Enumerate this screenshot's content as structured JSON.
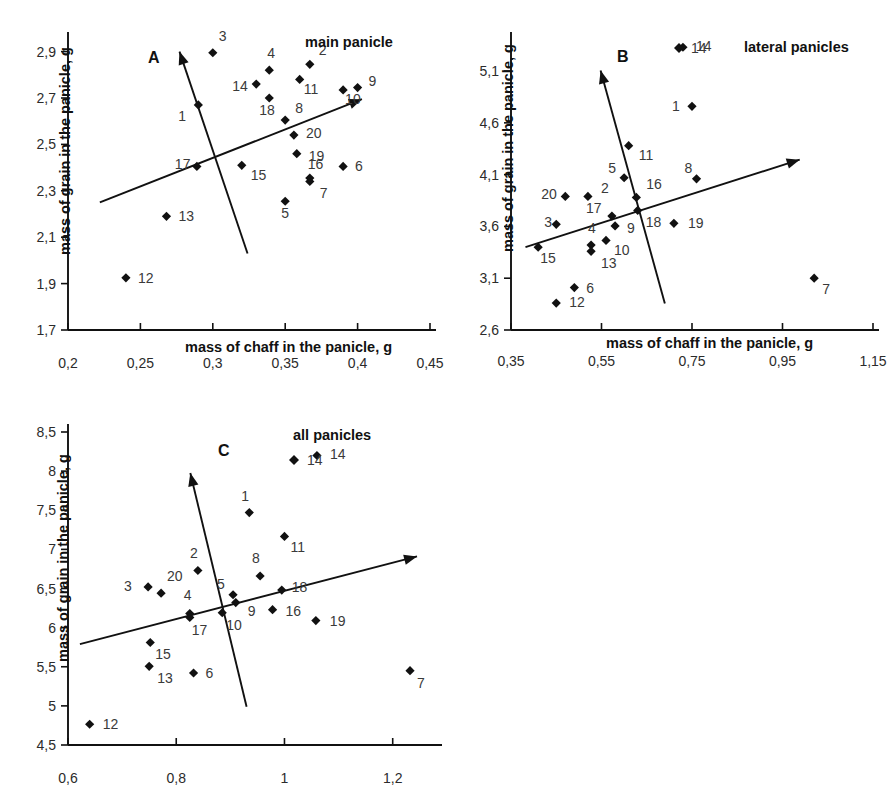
{
  "figure": {
    "axis_x_title": "mass of chaff in the panicle, g",
    "axis_y_title": "mass of grain in the panicle, g"
  },
  "chart_data": [
    {
      "type": "scatter",
      "panel": "A",
      "title": "main panicle",
      "xlabel": "mass of chaff in the panicle, g",
      "ylabel": "mass of grain in the panicle, g",
      "xlim": [
        0.2,
        0.45
      ],
      "ylim": [
        1.7,
        2.95
      ],
      "xticks": [
        "0,2",
        "0,25",
        "0,3",
        "0,35",
        "0,4",
        "0,45"
      ],
      "xtick_values": [
        0.2,
        0.25,
        0.3,
        0.35,
        0.4,
        0.45
      ],
      "yticks": [
        "1,7",
        "1,9",
        "2,1",
        "2,3",
        "2,5",
        "2,7",
        "2,9"
      ],
      "ytick_values": [
        1.7,
        1.9,
        2.1,
        2.3,
        2.5,
        2.7,
        2.9
      ],
      "grid": false,
      "legend": null,
      "points": [
        {
          "label": "1",
          "x": 0.29,
          "y": 2.67,
          "lx": -20,
          "ly": 16
        },
        {
          "label": "2",
          "x": 0.367,
          "y": 2.845,
          "lx": 9,
          "ly": -9
        },
        {
          "label": "3",
          "x": 0.3,
          "y": 2.895,
          "lx": 6,
          "ly": -12
        },
        {
          "label": "4",
          "x": 0.339,
          "y": 2.82,
          "lx": -2,
          "ly": -12
        },
        {
          "label": "5",
          "x": 0.35,
          "y": 2.255,
          "lx": -4,
          "ly": 17
        },
        {
          "label": "6",
          "x": 0.39,
          "y": 2.405,
          "lx": 12,
          "ly": 5
        },
        {
          "label": "7",
          "x": 0.367,
          "y": 2.34,
          "lx": 10,
          "ly": 16
        },
        {
          "label": "8",
          "x": 0.35,
          "y": 2.605,
          "lx": 10,
          "ly": -7
        },
        {
          "label": "9",
          "x": 0.4,
          "y": 2.745,
          "lx": 11,
          "ly": -2
        },
        {
          "label": "10",
          "x": 0.39,
          "y": 2.735,
          "lx": 2,
          "ly": 14
        },
        {
          "label": "11",
          "x": 0.36,
          "y": 2.78,
          "lx": 4,
          "ly": 15
        },
        {
          "label": "12",
          "x": 0.24,
          "y": 1.925,
          "lx": 12,
          "ly": 5
        },
        {
          "label": "13",
          "x": 0.268,
          "y": 2.19,
          "lx": 12,
          "ly": 5
        },
        {
          "label": "14",
          "x": 0.33,
          "y": 2.76,
          "lx": -24,
          "ly": 7
        },
        {
          "label": "15",
          "x": 0.32,
          "y": 2.41,
          "lx": 9,
          "ly": 15
        },
        {
          "label": "16",
          "x": 0.367,
          "y": 2.355,
          "lx": -2,
          "ly": -9
        },
        {
          "label": "17",
          "x": 0.289,
          "y": 2.405,
          "lx": -22,
          "ly": 3
        },
        {
          "label": "18",
          "x": 0.339,
          "y": 2.7,
          "lx": -10,
          "ly": 17
        },
        {
          "label": "19",
          "x": 0.358,
          "y": 2.46,
          "lx": 12,
          "ly": 7
        },
        {
          "label": "20",
          "x": 0.356,
          "y": 2.54,
          "lx": 12,
          "ly": 3
        }
      ],
      "vectors": [
        {
          "name": "pc1",
          "x1": 0.222,
          "y1": 2.25,
          "x2": 0.403,
          "y2": 2.695
        },
        {
          "name": "pc2",
          "x1": 0.324,
          "y1": 2.03,
          "x2": 0.277,
          "y2": 2.9
        }
      ]
    },
    {
      "type": "scatter",
      "panel": "B",
      "title": "lateral panicles",
      "xlabel": "mass of chaff in the panicle, g",
      "ylabel": "mass of grain in the panicle, g",
      "xlim": [
        0.35,
        1.15
      ],
      "ylim": [
        2.6,
        5.4
      ],
      "xticks": [
        "0,35",
        "0,55",
        "0,75",
        "0,95",
        "1,15"
      ],
      "xtick_values": [
        0.35,
        0.55,
        0.75,
        0.95,
        1.15
      ],
      "yticks": [
        "2,6",
        "3,1",
        "3,6",
        "4,1",
        "4,6",
        "5,1"
      ],
      "ytick_values": [
        2.6,
        3.1,
        3.6,
        4.1,
        4.6,
        5.1
      ],
      "grid": false,
      "legend": {
        "label": "14",
        "marker": "diamond"
      },
      "points": [
        {
          "label": "1",
          "x": 0.75,
          "y": 4.76,
          "lx": -20,
          "ly": 5
        },
        {
          "label": "2",
          "x": 0.52,
          "y": 3.89,
          "lx": 13,
          "ly": -3
        },
        {
          "label": "3",
          "x": 0.45,
          "y": 3.62,
          "lx": -12,
          "ly": 3
        },
        {
          "label": "4",
          "x": 0.527,
          "y": 3.42,
          "lx": -3,
          "ly": -12
        },
        {
          "label": "5",
          "x": 0.6,
          "y": 4.07,
          "lx": -16,
          "ly": -5
        },
        {
          "label": "6",
          "x": 0.49,
          "y": 3.01,
          "lx": 12,
          "ly": 5
        },
        {
          "label": "7",
          "x": 1.02,
          "y": 3.1,
          "lx": 8,
          "ly": 16
        },
        {
          "label": "8",
          "x": 0.76,
          "y": 4.06,
          "lx": -12,
          "ly": -6
        },
        {
          "label": "9",
          "x": 0.58,
          "y": 3.605,
          "lx": 12,
          "ly": 7
        },
        {
          "label": "10",
          "x": 0.56,
          "y": 3.465,
          "lx": 8,
          "ly": 15
        },
        {
          "label": "11",
          "x": 0.61,
          "y": 4.38,
          "lx": 10,
          "ly": 14
        },
        {
          "label": "12",
          "x": 0.45,
          "y": 2.86,
          "lx": 13,
          "ly": 4
        },
        {
          "label": "13",
          "x": 0.527,
          "y": 3.36,
          "lx": 10,
          "ly": 17
        },
        {
          "label": "14",
          "x": 0.73,
          "y": 5.33,
          "lx": 13,
          "ly": 4
        },
        {
          "label": "15",
          "x": 0.41,
          "y": 3.4,
          "lx": 2,
          "ly": 16
        },
        {
          "label": "16",
          "x": 0.627,
          "y": 3.88,
          "lx": 10,
          "ly": -8
        },
        {
          "label": "17",
          "x": 0.573,
          "y": 3.7,
          "lx": -26,
          "ly": -3
        },
        {
          "label": "18",
          "x": 0.63,
          "y": 3.755,
          "lx": 8,
          "ly": 17
        },
        {
          "label": "19",
          "x": 0.71,
          "y": 3.63,
          "lx": 14,
          "ly": 5
        },
        {
          "label": "20",
          "x": 0.47,
          "y": 3.89,
          "lx": -24,
          "ly": 3
        }
      ],
      "vectors": [
        {
          "name": "pc1",
          "x1": 0.382,
          "y1": 3.4,
          "x2": 0.988,
          "y2": 4.245
        },
        {
          "name": "pc2",
          "x1": 0.69,
          "y1": 2.855,
          "x2": 0.548,
          "y2": 5.105
        }
      ]
    },
    {
      "type": "scatter",
      "panel": "C",
      "title": "all panicles",
      "xlabel": "mass of chaff in the panicle, g",
      "ylabel": "mass of grain in the panicle, g",
      "xlim": [
        0.6,
        1.28
      ],
      "ylim": [
        4.5,
        8.5
      ],
      "xticks": [
        "0,6",
        "0,8",
        "1",
        "1,2"
      ],
      "xtick_values": [
        0.6,
        0.8,
        1.0,
        1.2
      ],
      "yticks": [
        "4,5",
        "5",
        "5,5",
        "6",
        "6,5",
        "7",
        "7,5",
        "8",
        "8,5"
      ],
      "ytick_values": [
        4.5,
        5.0,
        5.5,
        6.0,
        6.5,
        7.0,
        7.5,
        8.0,
        8.5
      ],
      "grid": false,
      "legend": {
        "label": "14",
        "marker": "diamond"
      },
      "points": [
        {
          "label": "1",
          "x": 0.935,
          "y": 7.47,
          "lx": -8,
          "ly": -12
        },
        {
          "label": "2",
          "x": 0.84,
          "y": 6.73,
          "lx": -8,
          "ly": -13
        },
        {
          "label": "3",
          "x": 0.748,
          "y": 6.52,
          "lx": -24,
          "ly": 4
        },
        {
          "label": "4",
          "x": 0.825,
          "y": 6.18,
          "lx": -6,
          "ly": -14
        },
        {
          "label": "5",
          "x": 0.905,
          "y": 6.42,
          "lx": -16,
          "ly": -6
        },
        {
          "label": "6",
          "x": 0.832,
          "y": 5.42,
          "lx": 12,
          "ly": 5
        },
        {
          "label": "7",
          "x": 1.232,
          "y": 5.45,
          "lx": 7,
          "ly": 17
        },
        {
          "label": "8",
          "x": 0.955,
          "y": 6.66,
          "lx": -8,
          "ly": -13
        },
        {
          "label": "9",
          "x": 0.91,
          "y": 6.32,
          "lx": 12,
          "ly": 13
        },
        {
          "label": "10",
          "x": 0.885,
          "y": 6.19,
          "lx": 4,
          "ly": 17
        },
        {
          "label": "11",
          "x": 1.0,
          "y": 7.165,
          "lx": 6,
          "ly": 16
        },
        {
          "label": "12",
          "x": 0.64,
          "y": 4.765,
          "lx": 13,
          "ly": 5
        },
        {
          "label": "13",
          "x": 0.75,
          "y": 5.505,
          "lx": 8,
          "ly": 17
        },
        {
          "label": "14",
          "x": 1.06,
          "y": 8.2,
          "lx": 13,
          "ly": 4
        },
        {
          "label": "15",
          "x": 0.752,
          "y": 5.81,
          "lx": 5,
          "ly": 17
        },
        {
          "label": "16",
          "x": 0.978,
          "y": 6.23,
          "lx": 13,
          "ly": 6
        },
        {
          "label": "17",
          "x": 0.825,
          "y": 6.13,
          "lx": 2,
          "ly": 18
        },
        {
          "label": "18",
          "x": 0.995,
          "y": 6.48,
          "lx": 10,
          "ly": 2
        },
        {
          "label": "19",
          "x": 1.058,
          "y": 6.09,
          "lx": 14,
          "ly": 5
        },
        {
          "label": "20",
          "x": 0.772,
          "y": 6.44,
          "lx": 6,
          "ly": -12
        }
      ],
      "vectors": [
        {
          "name": "pc1",
          "x1": 0.622,
          "y1": 5.79,
          "x2": 1.245,
          "y2": 6.91
        },
        {
          "name": "pc2",
          "x1": 0.93,
          "y1": 4.99,
          "x2": 0.826,
          "y2": 7.975
        }
      ]
    }
  ]
}
